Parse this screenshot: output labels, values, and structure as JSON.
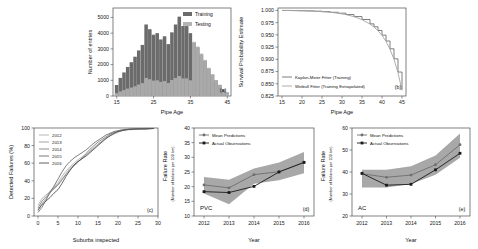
{
  "figure": {
    "panels": [
      "a",
      "b",
      "c",
      "d",
      "e"
    ]
  },
  "chart_data": [
    {
      "id": "a",
      "panel_tag": "(a)",
      "type": "bar",
      "title": "",
      "xlabel": "Pipe Age",
      "ylabel": "Number of entries",
      "xlim": [
        14,
        46
      ],
      "ylim": [
        0,
        5600
      ],
      "xticks": [
        15,
        25,
        35,
        45
      ],
      "yticks": [
        0,
        1000,
        2000,
        3000,
        4000,
        5000
      ],
      "grid": false,
      "legend_position": "top-right",
      "legend": [
        "Training",
        "Testing"
      ],
      "colors": {
        "Training": "#6b6b6b",
        "Testing": "#b4b4b4"
      },
      "bin_centers": [
        15,
        16,
        17,
        18,
        19,
        20,
        21,
        22,
        23,
        24,
        25,
        26,
        27,
        28,
        29,
        30,
        31,
        32,
        33,
        34,
        35,
        36,
        37,
        38,
        39,
        40,
        41,
        42,
        43,
        44,
        45
      ],
      "series": [
        {
          "name": "Training",
          "values": [
            700,
            1150,
            1500,
            1850,
            2150,
            2500,
            2900,
            3250,
            4550,
            4250,
            3900,
            4000,
            3600,
            3800,
            3300,
            4050,
            4550,
            5050,
            4450,
            4450,
            4000,
            3400,
            3100,
            2650,
            2250,
            1750,
            1350,
            1000,
            700,
            420,
            220
          ]
        },
        {
          "name": "Testing",
          "values": [
            180,
            290,
            380,
            470,
            540,
            620,
            730,
            820,
            1150,
            1070,
            980,
            1000,
            900,
            950,
            830,
            1020,
            1150,
            1270,
            1120,
            1120,
            1000,
            3450,
            3150,
            2700,
            2300,
            1800,
            1400,
            1020,
            720,
            430,
            230
          ]
        }
      ]
    },
    {
      "id": "b",
      "panel_tag": "(b)",
      "type": "line",
      "title": "",
      "xlabel": "Pipe Age",
      "ylabel": "Survival Probability Estimate",
      "xlim": [
        14,
        46
      ],
      "ylim": [
        0.825,
        1.005
      ],
      "xticks": [
        15,
        20,
        25,
        30,
        35,
        40,
        45
      ],
      "yticks": [
        0.825,
        0.85,
        0.875,
        0.9,
        0.925,
        0.95,
        0.975,
        1.0
      ],
      "ytick_labels": [
        "0.825",
        "0.850",
        "0.875",
        "0.900",
        "0.925",
        "0.950",
        "0.975",
        "1.000"
      ],
      "grid": false,
      "legend_position": "bottom-left",
      "legend": [
        "Kaplan-Meier Fitter (Training)",
        "Weibull Fitter (Training Extrapolated)"
      ],
      "colors": {
        "Kaplan-Meier Fitter (Training)": "#6f6f6f",
        "Weibull Fitter (Training Extrapolated)": "#9a9a9a"
      },
      "x": [
        15,
        17,
        19,
        21,
        23,
        25,
        27,
        29,
        31,
        33,
        35,
        37,
        38,
        39,
        40,
        41,
        42,
        43,
        44,
        45
      ],
      "series": [
        {
          "name": "Kaplan-Meier Fitter (Training)",
          "values": [
            1.0,
            0.9998,
            0.9995,
            0.9991,
            0.9985,
            0.9976,
            0.9963,
            0.9944,
            0.9916,
            0.9875,
            0.9815,
            0.9725,
            0.9665,
            0.959,
            0.9495,
            0.9375,
            0.9215,
            0.901,
            0.874,
            0.838
          ]
        },
        {
          "name": "Weibull Fitter (Training Extrapolated)",
          "values": [
            1.0,
            0.9998,
            0.9995,
            0.999,
            0.9984,
            0.9975,
            0.9962,
            0.9943,
            0.9915,
            0.9873,
            0.9812,
            0.972,
            0.966,
            0.9585,
            0.949,
            0.9368,
            0.9205,
            0.9,
            0.8725,
            0.8365
          ]
        }
      ]
    },
    {
      "id": "c",
      "panel_tag": "(c)",
      "type": "line",
      "title": "",
      "xlabel": "Suburbs inspected",
      "ylabel": "Detected Failures (%)",
      "xlim": [
        -1,
        30
      ],
      "ylim": [
        0,
        100
      ],
      "xticks": [
        0,
        5,
        10,
        15,
        20,
        25,
        30
      ],
      "yticks": [
        0,
        20,
        40,
        60,
        80,
        100
      ],
      "grid": false,
      "legend_position": "top-left",
      "legend": [
        "2012",
        "2013",
        "2014",
        "2015",
        "2016"
      ],
      "colors": {
        "2012": "#b0b0b0",
        "2013": "#999999",
        "2014": "#828282",
        "2015": "#6a6a6a",
        "2016": "#4f4f4f"
      },
      "x": [
        0,
        1,
        2,
        3,
        4,
        5,
        6,
        7,
        8,
        9,
        10,
        11,
        12,
        13,
        14,
        15,
        16,
        17,
        18,
        19,
        20,
        21,
        22,
        23,
        25,
        27,
        29
      ],
      "series": [
        {
          "name": "2012",
          "values": [
            12,
            20,
            24,
            28,
            33,
            38,
            45,
            51,
            56,
            60,
            64,
            67,
            70,
            74,
            78,
            82,
            85,
            88,
            91,
            93,
            95,
            97,
            98,
            98,
            98.5,
            99,
            99.5
          ]
        },
        {
          "name": "2013",
          "values": [
            6,
            14,
            20,
            26,
            32,
            36,
            42,
            48,
            54,
            58,
            62,
            65,
            69,
            73,
            77,
            81,
            85,
            89,
            92,
            94,
            96,
            97,
            98,
            98.5,
            99,
            99,
            99.5
          ]
        },
        {
          "name": "2014",
          "values": [
            9,
            17,
            22,
            27,
            31,
            35,
            41,
            47,
            52,
            57,
            61,
            66,
            71,
            76,
            80,
            84,
            87,
            90,
            93,
            95,
            96,
            97,
            98,
            98.5,
            99,
            99,
            99.5
          ]
        },
        {
          "name": "2015",
          "values": [
            4,
            10,
            18,
            27,
            34,
            42,
            50,
            57,
            62,
            66,
            69,
            72,
            75,
            79,
            83,
            86,
            89,
            92,
            94,
            96,
            97,
            98,
            98.5,
            99,
            99,
            99.5,
            99.5
          ]
        },
        {
          "name": "2016",
          "values": [
            7,
            13,
            17,
            21,
            26,
            30,
            37,
            45,
            52,
            58,
            62,
            65,
            68,
            72,
            76,
            80,
            84,
            88,
            91,
            94,
            96,
            97,
            98,
            98.5,
            99,
            99,
            99.5
          ]
        }
      ]
    },
    {
      "id": "d",
      "panel_tag": "(d)",
      "type": "line",
      "material": "PVC",
      "title": "",
      "xlabel": "Year",
      "ylabel": "Failure Rate",
      "ylabel_sub": "(Number of failures per 100 km)",
      "ylim": [
        10,
        40
      ],
      "yticks": [
        10,
        15,
        20,
        25,
        30,
        35,
        40
      ],
      "categories": [
        "2012",
        "2013",
        "2014",
        "2015",
        "2016"
      ],
      "grid": false,
      "legend_position": "top-left",
      "legend": [
        "Mean Predictions",
        "Actual Observations"
      ],
      "colors": {
        "Mean Predictions": "#808080",
        "Actual Observations": "#1a1a1a",
        "band": "#a8a8a8"
      },
      "series": [
        {
          "name": "Mean Predictions",
          "values": [
            20.6,
            19.6,
            24.1,
            25.1,
            28.2
          ]
        },
        {
          "name": "Actual Observations",
          "values": [
            18.3,
            18.0,
            20.1,
            25.0,
            28.3
          ]
        }
      ],
      "band_upper": [
        23.3,
        22.4,
        26.2,
        28.2,
        31.8
      ],
      "band_lower": [
        17.7,
        14.0,
        21.0,
        22.2,
        24.6
      ]
    },
    {
      "id": "e",
      "panel_tag": "(e)",
      "type": "line",
      "material": "AC",
      "title": "",
      "xlabel": "Year",
      "ylabel": "Failure Rate",
      "ylabel_sub": "(Number of failures per 100 km)",
      "ylim": [
        20,
        60
      ],
      "yticks": [
        20,
        30,
        40,
        50,
        60
      ],
      "categories": [
        "2012",
        "2013",
        "2014",
        "2015",
        "2016"
      ],
      "grid": false,
      "legend_position": "top-left",
      "legend": [
        "Mean Predictions",
        "Actual Observations"
      ],
      "colors": {
        "Mean Predictions": "#808080",
        "Actual Observations": "#1a1a1a",
        "band": "#a8a8a8"
      },
      "series": [
        {
          "name": "Mean Predictions",
          "values": [
            39.2,
            37.6,
            38.6,
            43.3,
            52.4
          ]
        },
        {
          "name": "Actual Observations",
          "values": [
            39.4,
            34.0,
            34.4,
            41.0,
            48.5
          ]
        }
      ],
      "band_upper": [
        41.0,
        41.0,
        42.6,
        47.5,
        57.5
      ],
      "band_lower": [
        33.0,
        33.0,
        34.6,
        38.8,
        46.5
      ]
    }
  ]
}
